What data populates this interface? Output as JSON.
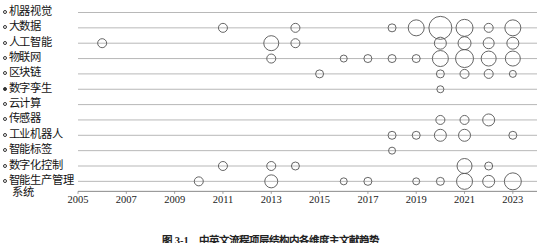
{
  "figure": {
    "caption": "图 3-1　中英文流程项层结构内各维度主文献趋势",
    "width": 541,
    "height": 243
  },
  "chart_data": {
    "type": "scatter",
    "title": "",
    "xlabel": "",
    "ylabel": "",
    "xlim": [
      2005,
      2024
    ],
    "ylim": [
      0,
      12
    ],
    "grid": true,
    "legend": false,
    "marker_style": "open-circle",
    "marker_color": "#555555",
    "size_encoding": "bubble area proportional to document count",
    "xticks": [
      2005,
      2007,
      2009,
      2011,
      2013,
      2015,
      2017,
      2019,
      2021,
      2023
    ],
    "xtick_labels": [
      "2005",
      "2007",
      "2009",
      "2011",
      "2013",
      "2015",
      "2017",
      "2019",
      "2021",
      "2023"
    ],
    "categories": [
      "机器视觉",
      "大数据",
      "人工智能",
      "物联网",
      "区块链",
      "数字孪生",
      "云计算",
      "传感器",
      "工业机器人",
      "智能标签",
      "数字化控制",
      "智能生产管理系统"
    ],
    "category_markers": [
      "open",
      "open",
      "open",
      "open",
      "open",
      "filled",
      "open",
      "open",
      "open",
      "open",
      "open",
      "open"
    ],
    "points": [
      {
        "category": "大数据",
        "x": 2011,
        "size": 4.5
      },
      {
        "category": "大数据",
        "x": 2014,
        "size": 4.5
      },
      {
        "category": "大数据",
        "x": 2018,
        "size": 4.0
      },
      {
        "category": "大数据",
        "x": 2019,
        "size": 8.0
      },
      {
        "category": "大数据",
        "x": 2020,
        "size": 11.5
      },
      {
        "category": "大数据",
        "x": 2021,
        "size": 8.5
      },
      {
        "category": "大数据",
        "x": 2022,
        "size": 4.5
      },
      {
        "category": "大数据",
        "x": 2023,
        "size": 8.0
      },
      {
        "category": "人工智能",
        "x": 2006,
        "size": 4.5
      },
      {
        "category": "人工智能",
        "x": 2013,
        "size": 7.5
      },
      {
        "category": "人工智能",
        "x": 2014,
        "size": 4.5
      },
      {
        "category": "人工智能",
        "x": 2020,
        "size": 6.0
      },
      {
        "category": "人工智能",
        "x": 2021,
        "size": 6.5
      },
      {
        "category": "人工智能",
        "x": 2022,
        "size": 5.5
      },
      {
        "category": "人工智能",
        "x": 2023,
        "size": 6.0
      },
      {
        "category": "物联网",
        "x": 2013,
        "size": 4.5
      },
      {
        "category": "物联网",
        "x": 2016,
        "size": 3.5
      },
      {
        "category": "物联网",
        "x": 2017,
        "size": 4.0
      },
      {
        "category": "物联网",
        "x": 2018,
        "size": 4.0
      },
      {
        "category": "物联网",
        "x": 2019,
        "size": 4.0
      },
      {
        "category": "物联网",
        "x": 2020,
        "size": 8.0
      },
      {
        "category": "物联网",
        "x": 2021,
        "size": 9.0
      },
      {
        "category": "物联网",
        "x": 2022,
        "size": 7.5
      },
      {
        "category": "物联网",
        "x": 2023,
        "size": 7.5
      },
      {
        "category": "区块链",
        "x": 2015,
        "size": 4.0
      },
      {
        "category": "区块链",
        "x": 2020,
        "size": 4.0
      },
      {
        "category": "区块链",
        "x": 2021,
        "size": 4.5
      },
      {
        "category": "区块链",
        "x": 2022,
        "size": 4.5
      },
      {
        "category": "区块链",
        "x": 2023,
        "size": 3.5
      },
      {
        "category": "数字孪生",
        "x": 2020,
        "size": 3.5
      },
      {
        "category": "传感器",
        "x": 2020,
        "size": 4.5
      },
      {
        "category": "传感器",
        "x": 2021,
        "size": 4.5
      },
      {
        "category": "传感器",
        "x": 2022,
        "size": 6.0
      },
      {
        "category": "工业机器人",
        "x": 2018,
        "size": 4.0
      },
      {
        "category": "工业机器人",
        "x": 2019,
        "size": 4.0
      },
      {
        "category": "工业机器人",
        "x": 2020,
        "size": 6.0
      },
      {
        "category": "工业机器人",
        "x": 2021,
        "size": 6.0
      },
      {
        "category": "工业机器人",
        "x": 2023,
        "size": 4.0
      },
      {
        "category": "智能标签",
        "x": 2018,
        "size": 3.5
      },
      {
        "category": "数字化控制",
        "x": 2011,
        "size": 4.5
      },
      {
        "category": "数字化控制",
        "x": 2013,
        "size": 4.5
      },
      {
        "category": "数字化控制",
        "x": 2014,
        "size": 4.0
      },
      {
        "category": "数字化控制",
        "x": 2021,
        "size": 7.5
      },
      {
        "category": "数字化控制",
        "x": 2022,
        "size": 4.0
      },
      {
        "category": "智能生产管理系统",
        "x": 2010,
        "size": 4.5
      },
      {
        "category": "智能生产管理系统",
        "x": 2013,
        "size": 6.5
      },
      {
        "category": "智能生产管理系统",
        "x": 2016,
        "size": 3.5
      },
      {
        "category": "智能生产管理系统",
        "x": 2017,
        "size": 4.0
      },
      {
        "category": "智能生产管理系统",
        "x": 2019,
        "size": 3.5
      },
      {
        "category": "智能生产管理系统",
        "x": 2020,
        "size": 4.0
      },
      {
        "category": "智能生产管理系统",
        "x": 2021,
        "size": 8.0
      },
      {
        "category": "智能生产管理系统",
        "x": 2022,
        "size": 6.0
      },
      {
        "category": "智能生产管理系统",
        "x": 2023,
        "size": 8.5
      }
    ]
  }
}
